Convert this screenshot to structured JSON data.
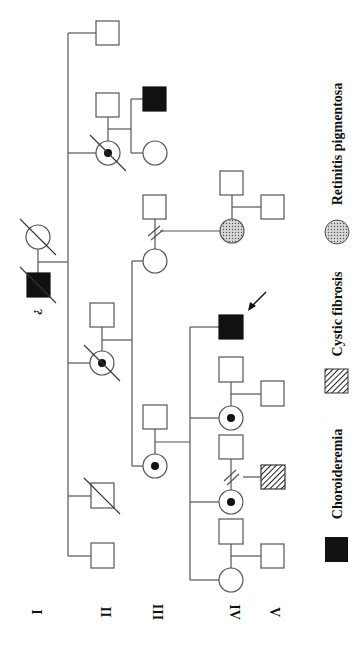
{
  "figure": {
    "type": "pedigree",
    "orientation": "rotated 90 degrees clockwise",
    "generations": [
      "I",
      "II",
      "III",
      "IV",
      "V"
    ],
    "unknown_marker": "?",
    "legend": [
      {
        "symbol": "filled-square",
        "label": "Choroideremia",
        "color": "#111111"
      },
      {
        "symbol": "hatched-square",
        "label": "Cystic fibrosis",
        "color": "#333333"
      },
      {
        "symbol": "stippled-circle",
        "label": "Retinitis pigmentosa",
        "color": "#999999"
      }
    ],
    "individuals": [
      {
        "id": "I-1",
        "generation": "I",
        "sex": "male",
        "status": "affected-choroideremia",
        "deceased": true,
        "note": "?"
      },
      {
        "id": "I-2",
        "generation": "I",
        "sex": "female",
        "status": "unaffected",
        "deceased": true
      },
      {
        "id": "II-1",
        "generation": "II",
        "sex": "male",
        "status": "unaffected",
        "deceased": false
      },
      {
        "id": "II-2",
        "generation": "II",
        "sex": "male",
        "status": "unaffected",
        "deceased": true
      },
      {
        "id": "II-3",
        "generation": "II",
        "sex": "female",
        "status": "carrier",
        "deceased": true
      },
      {
        "id": "II-3-spouse",
        "generation": "II",
        "sex": "male",
        "status": "unaffected",
        "deceased": false
      },
      {
        "id": "II-4",
        "generation": "II",
        "sex": "female",
        "status": "carrier",
        "deceased": true
      },
      {
        "id": "II-4-spouse",
        "generation": "II",
        "sex": "male",
        "status": "unaffected",
        "deceased": false
      },
      {
        "id": "II-5",
        "generation": "II",
        "sex": "male",
        "status": "unaffected",
        "deceased": false
      },
      {
        "id": "III-1",
        "generation": "III",
        "sex": "female",
        "status": "carrier",
        "deceased": false
      },
      {
        "id": "III-1-spouse",
        "generation": "III",
        "sex": "male",
        "status": "unaffected",
        "deceased": false
      },
      {
        "id": "III-2",
        "generation": "III",
        "sex": "female",
        "status": "unaffected",
        "deceased": false,
        "relationship": "divorced"
      },
      {
        "id": "III-2-spouse",
        "generation": "III",
        "sex": "male",
        "status": "unaffected",
        "deceased": false
      },
      {
        "id": "III-2-child",
        "generation": "IV",
        "sex": "female",
        "status": "affected-retinitis-pigmentosa",
        "deceased": false
      },
      {
        "id": "III-3",
        "generation": "III",
        "sex": "male",
        "status": "affected-choroideremia",
        "deceased": false
      },
      {
        "id": "III-4",
        "generation": "III",
        "sex": "female",
        "status": "unaffected",
        "deceased": false
      },
      {
        "id": "IV-1",
        "generation": "IV",
        "sex": "female",
        "status": "unaffected",
        "deceased": false
      },
      {
        "id": "IV-2",
        "generation": "IV",
        "sex": "female",
        "status": "carrier",
        "deceased": false,
        "relationship": "divorced"
      },
      {
        "id": "IV-3",
        "generation": "IV",
        "sex": "female",
        "status": "carrier",
        "deceased": false
      },
      {
        "id": "IV-4",
        "generation": "IV",
        "sex": "male",
        "status": "affected-choroideremia",
        "deceased": false,
        "proband": true
      },
      {
        "id": "V-1",
        "generation": "V",
        "sex": "male",
        "status": "unaffected"
      },
      {
        "id": "V-2",
        "generation": "V",
        "sex": "male",
        "status": "affected-cystic-fibrosis"
      },
      {
        "id": "V-3",
        "generation": "V",
        "sex": "male",
        "status": "unaffected"
      }
    ]
  },
  "labels": {
    "gen_I": "I",
    "gen_II": "II",
    "gen_III": "III",
    "gen_IV": "IV",
    "gen_V": "V",
    "unknown": "?",
    "legend_choroideremia": "Choroideremia",
    "legend_cystic_fibrosis": "Cystic fibrosis",
    "legend_retinitis": "Retinitis pigmentosa"
  }
}
